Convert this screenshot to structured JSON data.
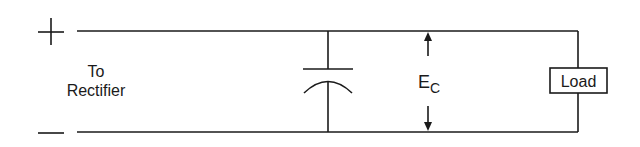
{
  "diagram": {
    "type": "circuit",
    "terminals": {
      "positive": "+",
      "negative": "−"
    },
    "source_label": {
      "line1": "To",
      "line2": "Rectifier"
    },
    "components": [
      {
        "id": "capacitor",
        "kind": "capacitor",
        "label": ""
      },
      {
        "id": "load",
        "kind": "resistor-box",
        "label": "Load"
      }
    ],
    "voltage_label": {
      "main": "E",
      "subscript": "C"
    },
    "colors": {
      "line": "#1a1a1a",
      "background": "#ffffff"
    }
  }
}
